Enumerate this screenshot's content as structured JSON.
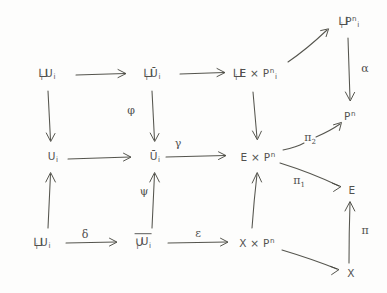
{
  "diagram": {
    "ink_color": "#46463f",
    "background_color": "#fdfdfc",
    "nodes": [
      {
        "id": "n1",
        "op": "⊔",
        "opsub": "i",
        "base": "U",
        "sub": "i",
        "sup": "",
        "overline": false,
        "x": 47,
        "y": 74
      },
      {
        "id": "n2",
        "op": "⊔",
        "opsub": "i",
        "base": "Ū",
        "sub": "i",
        "sup": "",
        "overline": false,
        "x": 152,
        "y": 74
      },
      {
        "id": "n3",
        "op": "⊔",
        "opsub": "i",
        "base": "E × P",
        "sub": "i",
        "sup": "n",
        "overline": false,
        "x": 255,
        "y": 74
      },
      {
        "id": "n4",
        "op": "⊔",
        "opsub": "i",
        "base": "P",
        "sub": "i",
        "sup": "n",
        "overline": false,
        "x": 349,
        "y": 22
      },
      {
        "id": "n5",
        "op": "",
        "opsub": "",
        "base": "U",
        "sub": "i",
        "sup": "",
        "overline": false,
        "x": 53,
        "y": 157
      },
      {
        "id": "n6",
        "op": "",
        "opsub": "",
        "base": "Ū",
        "sub": "i",
        "sup": "",
        "overline": false,
        "x": 155,
        "y": 157
      },
      {
        "id": "n7",
        "op": "",
        "opsub": "",
        "base": "E × P",
        "sub": "",
        "sup": "n",
        "overline": false,
        "x": 258,
        "y": 157
      },
      {
        "id": "n8",
        "op": "",
        "opsub": "",
        "base": "P",
        "sub": "",
        "sup": "n",
        "overline": false,
        "x": 350,
        "y": 116
      },
      {
        "id": "n9",
        "op": "",
        "opsub": "",
        "base": "E",
        "sub": "",
        "sup": "",
        "overline": false,
        "x": 352,
        "y": 190
      },
      {
        "id": "n10",
        "op": "⊔",
        "opsub": "i",
        "base": "U",
        "sub": "i",
        "sup": "",
        "overline": false,
        "x": 42,
        "y": 243
      },
      {
        "id": "n11",
        "op": "∪",
        "opsub": "i",
        "base": "U",
        "sub": "i",
        "sup": "",
        "overline": true,
        "x": 143,
        "y": 243
      },
      {
        "id": "n12",
        "op": "",
        "opsub": "",
        "base": "X × P",
        "sub": "",
        "sup": "n",
        "overline": false,
        "x": 257,
        "y": 243
      },
      {
        "id": "n13",
        "op": "",
        "opsub": "",
        "base": "X",
        "sub": "",
        "sup": "",
        "overline": false,
        "x": 351,
        "y": 273
      }
    ],
    "arrow_labels": [
      {
        "id": "phi",
        "text": "φ",
        "sub": "",
        "x": 131,
        "y": 110
      },
      {
        "id": "psi",
        "text": "ψ",
        "sub": "",
        "x": 144,
        "y": 191
      },
      {
        "id": "gamma",
        "text": "γ",
        "sub": "",
        "x": 178,
        "y": 143
      },
      {
        "id": "delta",
        "text": "δ",
        "sub": "",
        "x": 85,
        "y": 234
      },
      {
        "id": "epsilon",
        "text": "ε",
        "sub": "",
        "x": 198,
        "y": 233
      },
      {
        "id": "alpha",
        "text": "α",
        "sub": "",
        "x": 365,
        "y": 68
      },
      {
        "id": "pi2",
        "text": "π",
        "sub": "2",
        "x": 310,
        "y": 139
      },
      {
        "id": "pi1",
        "text": "π",
        "sub": "1",
        "x": 299,
        "y": 182
      },
      {
        "id": "pi",
        "text": "π",
        "sub": "",
        "x": 365,
        "y": 230
      }
    ],
    "edges": [
      {
        "id": "e-n1-n2",
        "from": "n1",
        "to": "n2",
        "label": ""
      },
      {
        "id": "e-n2-n3",
        "from": "n2",
        "to": "n3",
        "label": ""
      },
      {
        "id": "e-n1-n5",
        "from": "n1",
        "to": "n5",
        "label": ""
      },
      {
        "id": "e-n2-n6",
        "from": "n2",
        "to": "n6",
        "label": "φ"
      },
      {
        "id": "e-n3-n7",
        "from": "n3",
        "to": "n7",
        "label": ""
      },
      {
        "id": "e-n3-n4",
        "from": "n3",
        "to": "n4",
        "label": ""
      },
      {
        "id": "e-n4-n8",
        "from": "n4",
        "to": "n8",
        "label": "α"
      },
      {
        "id": "e-n5-n6",
        "from": "n5",
        "to": "n6",
        "label": ""
      },
      {
        "id": "e-n6-n7",
        "from": "n6",
        "to": "n7",
        "label": "γ"
      },
      {
        "id": "e-n10-n5",
        "from": "n10",
        "to": "n5",
        "label": ""
      },
      {
        "id": "e-n11-n6",
        "from": "n11",
        "to": "n6",
        "label": "ψ"
      },
      {
        "id": "e-n12-n7",
        "from": "n12",
        "to": "n7",
        "label": ""
      },
      {
        "id": "e-n10-n11",
        "from": "n10",
        "to": "n11",
        "label": "δ"
      },
      {
        "id": "e-n11-n12",
        "from": "n11",
        "to": "n12",
        "label": "ε"
      },
      {
        "id": "e-n7-n9",
        "from": "n7",
        "to": "n9",
        "label": "π₁"
      },
      {
        "id": "e-n12-n13",
        "from": "n12",
        "to": "n13",
        "label": ""
      },
      {
        "id": "e-n13-n9",
        "from": "n13",
        "to": "n9",
        "label": "π"
      },
      {
        "id": "e-pi2",
        "from": "n7",
        "to": "n8",
        "label": "π₂"
      }
    ]
  }
}
